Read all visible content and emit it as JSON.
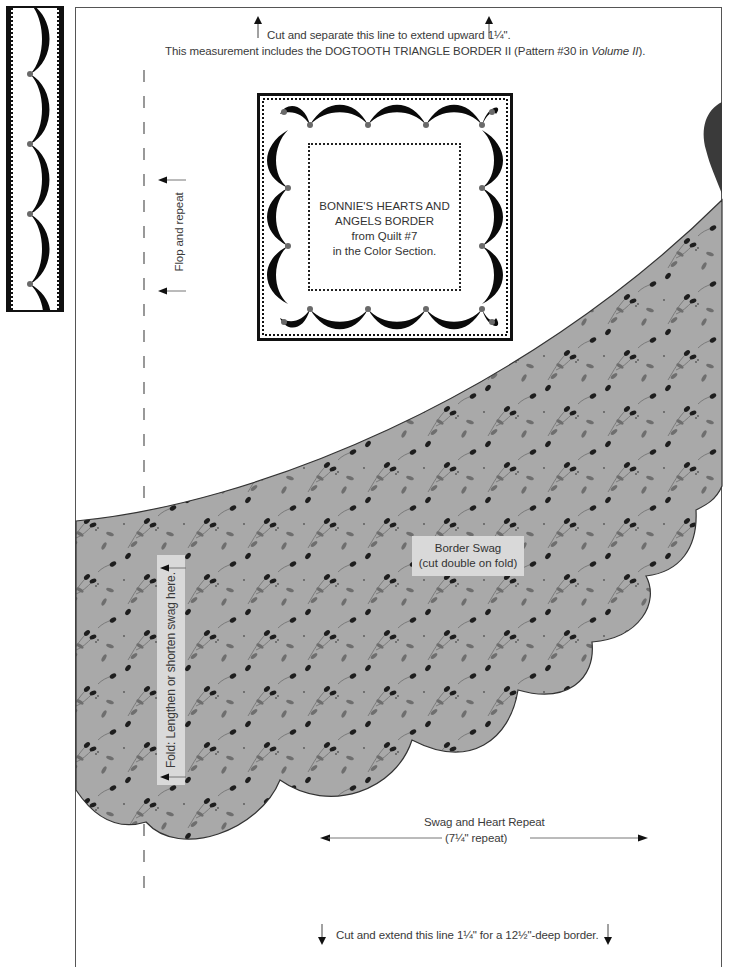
{
  "colors": {
    "fabric": "#a9a9a9",
    "bud": "#1e1e1e",
    "leaf": "#6e6e6e",
    "heart": "#3a3a3a",
    "frame": "#555555",
    "label_bg": "#d9d9d9"
  },
  "top_note": {
    "line1": "Cut and separate this line to extend upward 1¼\".",
    "line2_prefix": "This measurement includes the DOGTOOTH TRIANGLE BORDER II (Pattern #30 in ",
    "line2_italic": "Volume II",
    "line2_suffix": ")."
  },
  "flop_label": "Flop and repeat",
  "mini_quilt": {
    "lines": [
      "BONNIE'S HEARTS AND",
      "ANGELS BORDER",
      "from Quilt #7",
      "in the Color Section."
    ]
  },
  "fold_label": "Fold: Lengthen or shorten swag here.",
  "swag_label": {
    "line1": "Border Swag",
    "line2": "(cut double on fold)"
  },
  "repeat_label": {
    "line1": "Swag and Heart Repeat",
    "line2": "(7¼\" repeat)"
  },
  "bottom_note": "Cut and extend this line 1¼\" for a 12½\"-deep border."
}
